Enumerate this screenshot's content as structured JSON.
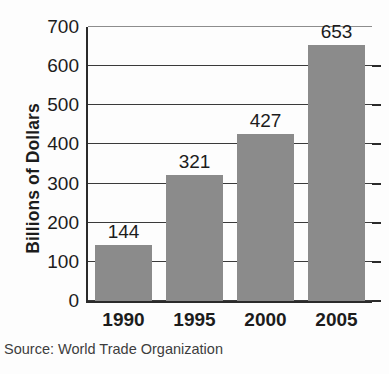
{
  "chart_data": {
    "type": "bar",
    "title": "",
    "xlabel": "",
    "ylabel": "Billions of Dollars",
    "categories": [
      "1990",
      "1995",
      "2000",
      "2005"
    ],
    "values": [
      144,
      321,
      427,
      653
    ],
    "value_labels": [
      "144",
      "321",
      "427",
      "653"
    ],
    "ylim": [
      0,
      700
    ],
    "yticks": [
      0,
      100,
      200,
      300,
      400,
      500,
      600,
      700
    ],
    "ytick_labels": [
      "0",
      "100",
      "200",
      "300",
      "400",
      "500",
      "600",
      "700"
    ],
    "grid": true,
    "legend": false,
    "bar_color": "#8b8b8b",
    "axis_color": "#2b2b2b",
    "text_color": "#1c1c1c",
    "background": "#fdfdfd"
  },
  "source": {
    "text": "Source: World Trade Organization"
  }
}
